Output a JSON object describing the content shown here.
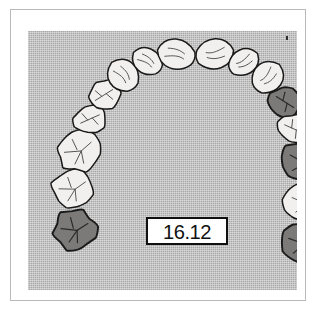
{
  "figure": {
    "kind": "dental-arch-diagram",
    "view": "maxillary-occlusal",
    "label": "16.12",
    "label_box": {
      "fill": "#ffffff",
      "border": "#101010"
    },
    "plate": {
      "background": "#a8a8a8",
      "texture": "halftone-screen",
      "speck": "corner-speck"
    },
    "frame": {
      "border": "#b9b9b9",
      "page": "#ffffff"
    }
  },
  "legend": {
    "light_fill": "#f2f0ee",
    "dark_fill": "#7c7a78",
    "outline": "#1a1a1a",
    "light_meaning": "unshaded tooth",
    "dark_meaning": "shaded tooth"
  },
  "teeth": [
    {
      "id": "UL8",
      "name": "upper-left-third-molar",
      "shade": "dark",
      "cx": 47,
      "cy": 199,
      "rx": 22,
      "ry": 21,
      "rot": -8,
      "type": "molar"
    },
    {
      "id": "UL7",
      "name": "upper-left-second-molar",
      "shade": "light",
      "cx": 45,
      "cy": 158,
      "rx": 22,
      "ry": 20,
      "rot": -12,
      "type": "molar"
    },
    {
      "id": "UL6",
      "name": "upper-left-first-molar",
      "shade": "light",
      "cx": 51,
      "cy": 120,
      "rx": 23,
      "ry": 21,
      "rot": -18,
      "type": "molar"
    },
    {
      "id": "UL5",
      "name": "upper-left-second-premolar",
      "shade": "light",
      "cx": 62,
      "cy": 88,
      "rx": 17,
      "ry": 15,
      "rot": -24,
      "type": "premolar"
    },
    {
      "id": "UL4",
      "name": "upper-left-first-premolar",
      "shade": "light",
      "cx": 76,
      "cy": 64,
      "rx": 17,
      "ry": 15,
      "rot": -32,
      "type": "premolar"
    },
    {
      "id": "UL3",
      "name": "upper-left-canine",
      "shade": "light",
      "cx": 95,
      "cy": 44,
      "rx": 19,
      "ry": 17,
      "rot": -42,
      "type": "canine"
    },
    {
      "id": "UL2",
      "name": "upper-left-lateral-incisor",
      "shade": "light",
      "cx": 119,
      "cy": 30,
      "rx": 16,
      "ry": 16,
      "rot": -58,
      "type": "incisor"
    },
    {
      "id": "UL1",
      "name": "upper-left-central-incisor",
      "shade": "light",
      "cx": 148,
      "cy": 23,
      "rx": 19,
      "ry": 19,
      "rot": -78,
      "type": "incisor"
    },
    {
      "id": "UR1",
      "name": "upper-right-central-incisor",
      "shade": "light",
      "cx": 187,
      "cy": 23,
      "rx": 19,
      "ry": 19,
      "rot": 78,
      "type": "incisor"
    },
    {
      "id": "UR2",
      "name": "upper-right-lateral-incisor",
      "shade": "light",
      "cx": 216,
      "cy": 31,
      "rx": 16,
      "ry": 16,
      "rot": 58,
      "type": "incisor"
    },
    {
      "id": "UR3",
      "name": "upper-right-canine",
      "shade": "light",
      "cx": 240,
      "cy": 46,
      "rx": 19,
      "ry": 17,
      "rot": 42,
      "type": "canine"
    },
    {
      "id": "UR4",
      "name": "upper-right-first-premolar",
      "shade": "dark",
      "cx": 257,
      "cy": 71,
      "rx": 17,
      "ry": 15,
      "rot": 32,
      "type": "premolar"
    },
    {
      "id": "UR5",
      "name": "upper-right-second-premolar",
      "shade": "light",
      "cx": 266,
      "cy": 98,
      "rx": 17,
      "ry": 15,
      "rot": 24,
      "type": "premolar"
    },
    {
      "id": "UR6",
      "name": "upper-right-first-molar",
      "shade": "dark",
      "cx": 275,
      "cy": 131,
      "rx": 23,
      "ry": 21,
      "rot": 16,
      "type": "molar"
    },
    {
      "id": "UR7",
      "name": "upper-right-second-molar",
      "shade": "light",
      "cx": 277,
      "cy": 172,
      "rx": 22,
      "ry": 20,
      "rot": 10,
      "type": "molar"
    },
    {
      "id": "UR8",
      "name": "upper-right-third-molar",
      "shade": "dark",
      "cx": 274,
      "cy": 212,
      "rx": 22,
      "ry": 21,
      "rot": 6,
      "type": "molar"
    }
  ]
}
